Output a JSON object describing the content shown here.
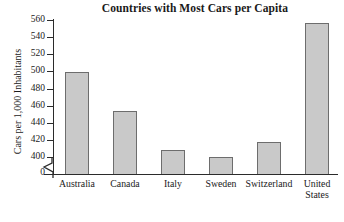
{
  "chart_data": {
    "type": "bar",
    "title": "Countries with Most Cars per Capita",
    "xlabel": "",
    "ylabel": "Cars per 1,000 Inhabitants",
    "categories": [
      "Australia",
      "Canada",
      "Italy",
      "Sweden",
      "Switzerland",
      "United States"
    ],
    "category_lines": [
      [
        "Australia"
      ],
      [
        "Canada"
      ],
      [
        "Italy"
      ],
      [
        "Sweden"
      ],
      [
        "Switzerland"
      ],
      [
        "United",
        "States"
      ]
    ],
    "values": [
      499,
      454,
      408,
      400,
      418,
      557
    ],
    "ylim": [
      396,
      560
    ],
    "yticks": [
      400,
      420,
      440,
      460,
      480,
      500,
      520,
      540,
      560
    ],
    "ytick_labels": [
      "400",
      "420",
      "440",
      "460",
      "480",
      "500",
      "520",
      "540",
      "560"
    ],
    "zero_tick_label": "0",
    "axis_break": true,
    "grid": false,
    "legend": false,
    "bar_fill_color": "#c9c9c9",
    "bar_border_color": "#6d6d6d",
    "axis_color": "#2b2b2b",
    "background_color": "#ffffff"
  }
}
